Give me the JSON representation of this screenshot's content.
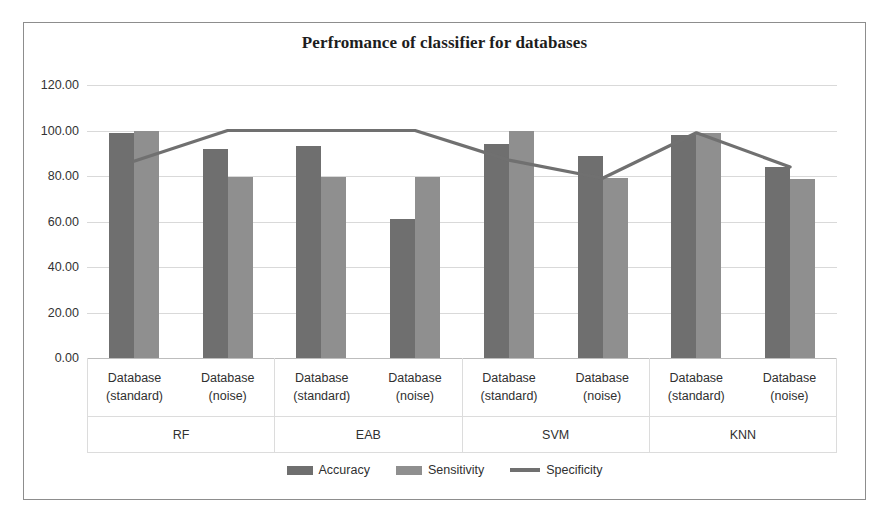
{
  "chart_data": {
    "type": "bar",
    "title": "Perfromance of classifier for databases",
    "xlabel": "",
    "ylabel": "",
    "ylim": [
      0,
      120
    ],
    "ytick_step": 20,
    "ytick_labels": [
      "120.00",
      "100.00",
      "80.00",
      "60.00",
      "40.00",
      "20.00",
      "0.00"
    ],
    "ytick_values": [
      120,
      100,
      80,
      60,
      40,
      20,
      0
    ],
    "grid": true,
    "legend_position": "bottom",
    "groups": [
      "RF",
      "EAB",
      "SVM",
      "KNN"
    ],
    "categories": [
      "Database (standard)",
      "Database (noise)",
      "Database (standard)",
      "Database (noise)",
      "Database (standard)",
      "Database (noise)",
      "Database (standard)",
      "Database (noise)"
    ],
    "category_line1": "Database",
    "category_line2_standard": "(standard)",
    "category_line2_noise": "(noise)",
    "series": [
      {
        "name": "Accuracy",
        "type": "bar",
        "color": "#6f6f6f",
        "values": [
          99.0,
          92.0,
          93.0,
          61.0,
          94.0,
          89.0,
          98.0,
          84.0
        ]
      },
      {
        "name": "Sensitivity",
        "type": "bar",
        "color": "#8f8f8f",
        "values": [
          100.0,
          79.5,
          79.5,
          79.5,
          100.0,
          79.0,
          99.0,
          78.5
        ]
      },
      {
        "name": "Specificity",
        "type": "line",
        "color": "#707070",
        "values": [
          86.5,
          100.0,
          100.0,
          100.0,
          87.0,
          79.0,
          99.0,
          84.0
        ]
      }
    ]
  },
  "colors": {
    "accuracy": "#6f6f6f",
    "sensitivity": "#8f8f8f",
    "specificity": "#707070",
    "gridline": "#d9d9d9",
    "frame": "#8d8d8d",
    "text": "#303030"
  },
  "legend": {
    "items": [
      {
        "label": "Accuracy",
        "marker": "bar-swatch-dark"
      },
      {
        "label": "Sensitivity",
        "marker": "bar-swatch-light"
      },
      {
        "label": "Specificity",
        "marker": "line-swatch"
      }
    ]
  }
}
